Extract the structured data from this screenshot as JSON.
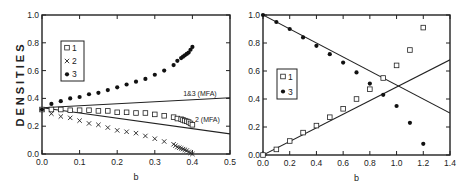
{
  "chart_data": [
    {
      "type": "scatter",
      "panel": "left",
      "title": "",
      "xlabel": "b",
      "ylabel": "DENSITIES",
      "xlim": [
        0.0,
        0.5
      ],
      "ylim": [
        0.0,
        1.0
      ],
      "xticks": [
        "0.0",
        "0.1",
        "0.2",
        "0.3",
        "0.4",
        "0.5"
      ],
      "yticks": [
        "0.0",
        "0.2",
        "0.4",
        "0.6",
        "0.8",
        "1.0"
      ],
      "grid": false,
      "legend_position": "upper-left",
      "series": [
        {
          "name": "1",
          "marker": "open-square",
          "x": [
            0.0,
            0.025,
            0.05,
            0.075,
            0.1,
            0.125,
            0.15,
            0.175,
            0.2,
            0.225,
            0.25,
            0.275,
            0.3,
            0.325,
            0.35,
            0.36,
            0.37,
            0.375,
            0.38,
            0.385,
            0.39,
            0.395,
            0.4
          ],
          "y": [
            0.32,
            0.32,
            0.32,
            0.315,
            0.315,
            0.315,
            0.31,
            0.31,
            0.3,
            0.3,
            0.295,
            0.295,
            0.285,
            0.275,
            0.265,
            0.255,
            0.25,
            0.245,
            0.24,
            0.235,
            0.23,
            0.22,
            0.21
          ]
        },
        {
          "name": "2",
          "marker": "x",
          "x": [
            0.025,
            0.05,
            0.075,
            0.1,
            0.125,
            0.15,
            0.175,
            0.2,
            0.225,
            0.25,
            0.275,
            0.3,
            0.325,
            0.35,
            0.355,
            0.36,
            0.365,
            0.37,
            0.375,
            0.38,
            0.385,
            0.39,
            0.395,
            0.4
          ],
          "y": [
            0.29,
            0.27,
            0.26,
            0.24,
            0.22,
            0.21,
            0.19,
            0.17,
            0.16,
            0.15,
            0.13,
            0.11,
            0.09,
            0.07,
            0.06,
            0.05,
            0.045,
            0.04,
            0.035,
            0.03,
            0.025,
            0.015,
            0.008,
            0.0
          ]
        },
        {
          "name": "3",
          "marker": "filled-circle",
          "x": [
            0.0,
            0.025,
            0.05,
            0.075,
            0.1,
            0.125,
            0.15,
            0.175,
            0.2,
            0.225,
            0.25,
            0.275,
            0.3,
            0.325,
            0.35,
            0.36,
            0.37,
            0.375,
            0.38,
            0.385,
            0.39,
            0.395,
            0.4
          ],
          "y": [
            0.32,
            0.36,
            0.38,
            0.4,
            0.41,
            0.43,
            0.44,
            0.46,
            0.48,
            0.5,
            0.52,
            0.54,
            0.57,
            0.6,
            0.64,
            0.67,
            0.69,
            0.7,
            0.71,
            0.72,
            0.73,
            0.75,
            0.77
          ]
        },
        {
          "name": "1&3 (MFA)",
          "marker": "line",
          "x": [
            0.0,
            0.5
          ],
          "y": [
            0.333,
            0.405
          ]
        },
        {
          "name": "2 (MFA)",
          "marker": "line",
          "x": [
            0.0,
            0.5
          ],
          "y": [
            0.333,
            0.145
          ]
        }
      ],
      "annotations": [
        {
          "text": "1&3 (MFA)",
          "x": 0.42,
          "y": 0.42
        },
        {
          "text": "2 (MFA)",
          "x": 0.44,
          "y": 0.23
        }
      ]
    },
    {
      "type": "scatter",
      "panel": "right",
      "title": "",
      "xlabel": "b",
      "ylabel": "",
      "xlim": [
        0.0,
        1.4
      ],
      "ylim": [
        0.0,
        1.0
      ],
      "xticks": [
        "0.0",
        "0.2",
        "0.4",
        "0.6",
        "0.8",
        "1.0",
        "1.2",
        "1.4"
      ],
      "yticks": [
        "0.0",
        "0.2",
        "0.4",
        "0.6",
        "0.8",
        "1.0"
      ],
      "grid": false,
      "legend_position": "center-left",
      "series": [
        {
          "name": "1",
          "marker": "open-square",
          "x": [
            0.0,
            0.1,
            0.2,
            0.3,
            0.4,
            0.5,
            0.6,
            0.7,
            0.8,
            0.9,
            1.0,
            1.1,
            1.2
          ],
          "y": [
            0.0,
            0.04,
            0.1,
            0.16,
            0.21,
            0.27,
            0.33,
            0.4,
            0.47,
            0.55,
            0.64,
            0.75,
            0.91
          ]
        },
        {
          "name": "3",
          "marker": "filled-circle",
          "x": [
            0.0,
            0.1,
            0.2,
            0.3,
            0.4,
            0.5,
            0.6,
            0.7,
            0.8,
            0.9,
            1.0,
            1.1,
            1.2
          ],
          "y": [
            1.0,
            0.95,
            0.9,
            0.84,
            0.78,
            0.72,
            0.66,
            0.59,
            0.51,
            0.43,
            0.35,
            0.23,
            0.08
          ]
        },
        {
          "name": "line-1",
          "marker": "line",
          "x": [
            0.0,
            1.4
          ],
          "y": [
            0.0,
            0.68
          ]
        },
        {
          "name": "line-3",
          "marker": "line",
          "x": [
            0.0,
            1.4
          ],
          "y": [
            1.0,
            0.3
          ]
        }
      ]
    }
  ],
  "left": {
    "ylabel": "DENSITIES",
    "xlabel": "b",
    "legend": [
      "1",
      "2",
      "3"
    ],
    "annotations": [
      "1&3 (MFA)",
      "2 (MFA)"
    ]
  },
  "right": {
    "xlabel": "b",
    "legend": [
      "1",
      "3"
    ]
  }
}
